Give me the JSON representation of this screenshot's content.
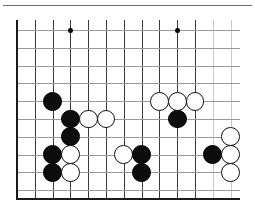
{
  "diagram": {
    "kind": "go-board-position",
    "board": {
      "columns": 13,
      "rows": 10,
      "origin_x": 17,
      "origin_y": 30,
      "spacing": 17.8,
      "visible_edges": [
        "left",
        "bottom"
      ],
      "line_color": "#3a3a3a",
      "faint_line_color": "#c9c9c9",
      "edge_color": "#1a1a1a",
      "background": "#ffffff"
    },
    "top_rule": {
      "color": "#6e6e6e",
      "x": 3,
      "y": 5,
      "width": 249
    },
    "star_points": [
      {
        "col": 3,
        "row": 0
      },
      {
        "col": 9,
        "row": 0
      }
    ],
    "stone_radius": 9.4,
    "stone_colors": {
      "black": "#0d0d0d",
      "white": "#ffffff",
      "white_outline": "#111111"
    },
    "stones": [
      {
        "color": "black",
        "col": 2,
        "row": 4
      },
      {
        "color": "white",
        "col": 8,
        "row": 4
      },
      {
        "color": "white",
        "col": 9,
        "row": 4
      },
      {
        "color": "white",
        "col": 10,
        "row": 4
      },
      {
        "color": "black",
        "col": 3,
        "row": 5
      },
      {
        "color": "white",
        "col": 4,
        "row": 5
      },
      {
        "color": "white",
        "col": 5,
        "row": 5
      },
      {
        "color": "black",
        "col": 9,
        "row": 5
      },
      {
        "color": "black",
        "col": 3,
        "row": 6
      },
      {
        "color": "white",
        "col": 12,
        "row": 6
      },
      {
        "color": "black",
        "col": 2,
        "row": 7
      },
      {
        "color": "white",
        "col": 3,
        "row": 7
      },
      {
        "color": "white",
        "col": 6,
        "row": 7
      },
      {
        "color": "black",
        "col": 7,
        "row": 7
      },
      {
        "color": "black",
        "col": 11,
        "row": 7
      },
      {
        "color": "white",
        "col": 12,
        "row": 7
      },
      {
        "color": "black",
        "col": 2,
        "row": 8
      },
      {
        "color": "white",
        "col": 3,
        "row": 8
      },
      {
        "color": "black",
        "col": 7,
        "row": 8
      },
      {
        "color": "white",
        "col": 12,
        "row": 8
      }
    ],
    "counts": {
      "black_stones": 9,
      "white_stones": 11,
      "total_stones": 20
    }
  }
}
